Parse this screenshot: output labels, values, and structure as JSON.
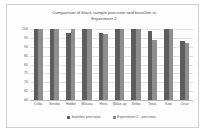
{
  "chart_data": {
    "type": "bar",
    "title": "Comparison of black sample precision and baseline in Experiment 2",
    "title_lines": [
      "Comparison of black sample precision and baseline in",
      "Experiment 2"
    ],
    "xlabel": "",
    "ylabel": "",
    "ylim": [
      60,
      100
    ],
    "yticks": [
      100,
      95,
      90,
      85,
      80,
      75,
      70,
      65,
      60
    ],
    "ytick_labels": [
      "100",
      "95",
      "90",
      "85",
      "80",
      "75",
      "70",
      "65",
      "60"
    ],
    "grid": true,
    "legend_position": "bottom",
    "categories": [
      "Criba",
      "Sendai",
      "Hobbit",
      "Mikasa",
      "Hero",
      "Wake-up",
      "Shiba",
      "Tesla",
      "Kiwi",
      "Zeus"
    ],
    "series": [
      {
        "name": "baseline precision",
        "color": "#5d5d5d",
        "values": [
          100,
          100,
          98,
          100,
          98,
          100,
          100,
          99,
          100,
          93
        ]
      },
      {
        "name": "Experiment 2 - precision",
        "color": "#8e8e8e",
        "values": [
          100,
          100,
          100,
          100,
          97,
          100,
          100,
          94,
          100,
          92
        ]
      }
    ]
  }
}
